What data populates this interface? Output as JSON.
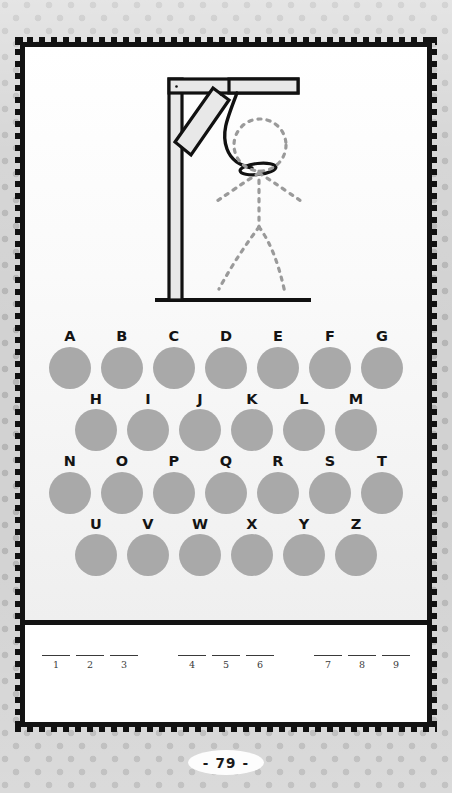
{
  "page": {
    "number_label": "- 79 -",
    "background_color": "#d2d2d2",
    "dot_color": "#b6b6b6",
    "card_border_color": "#131313",
    "card_background": "#ffffff"
  },
  "illustration": {
    "name": "hangman-gallows",
    "description": "Gallows with hanging rope noose and dotted outline of a stick figure",
    "post_fill": "#e8e8e8",
    "post_stroke": "#111111",
    "rope_color": "#111111",
    "figure_dot_color": "#9a9a9a"
  },
  "alphabet": {
    "dot_color": "#a9a9a9",
    "label_color": "#141414",
    "rows": [
      {
        "letters": [
          "A",
          "B",
          "C",
          "D",
          "E",
          "F",
          "G"
        ]
      },
      {
        "letters": [
          "H",
          "I",
          "J",
          "K",
          "L",
          "M"
        ]
      },
      {
        "letters": [
          "N",
          "O",
          "P",
          "Q",
          "R",
          "S",
          "T"
        ]
      },
      {
        "letters": [
          "U",
          "V",
          "W",
          "X",
          "Y",
          "Z"
        ]
      }
    ]
  },
  "answer": {
    "line_color": "#3a3a3a",
    "groups": [
      {
        "numbers": [
          "1",
          "2",
          "3"
        ]
      },
      {
        "numbers": [
          "4",
          "5",
          "6"
        ]
      },
      {
        "numbers": [
          "7",
          "8",
          "9"
        ]
      }
    ]
  }
}
